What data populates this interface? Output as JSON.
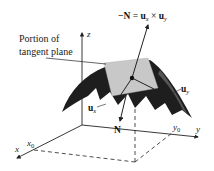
{
  "diagram": {
    "title_label": {
      "line1": "Portion of",
      "line2": "tangent plane"
    },
    "equation": {
      "lhs": "−N",
      "eq": " = ",
      "u1": "u",
      "u1_sub": "x",
      "times": " × ",
      "u2": "u",
      "u2_sub": "y"
    },
    "axes": {
      "x": "x",
      "y": "y",
      "z": "z",
      "x0": "x",
      "x0_sub": "0",
      "y0": "y",
      "y0_sub": "0"
    },
    "vectors": {
      "ux": "u",
      "ux_sub": "x",
      "uy": "u",
      "uy_sub": "y",
      "N": "N"
    },
    "colors": {
      "surface": "#1e1e1e",
      "plane": "#c8c8c8",
      "lines": "#222222",
      "background": "#ffffff"
    }
  }
}
